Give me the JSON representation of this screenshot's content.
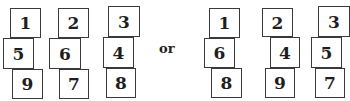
{
  "diagram": {
    "separator": "or",
    "left_arrangement": {
      "columns": [
        [
          "1",
          "5",
          "9"
        ],
        [
          "2",
          "6",
          "7"
        ],
        [
          "3",
          "4",
          "8"
        ]
      ]
    },
    "right_arrangement": {
      "columns": [
        [
          "1",
          "6",
          "8"
        ],
        [
          "2",
          "4",
          "9"
        ],
        [
          "3",
          "5",
          "7"
        ]
      ]
    },
    "colors": {
      "border": "#3a3a3a",
      "text": "#1e1e1e",
      "background": "#ffffff"
    }
  }
}
